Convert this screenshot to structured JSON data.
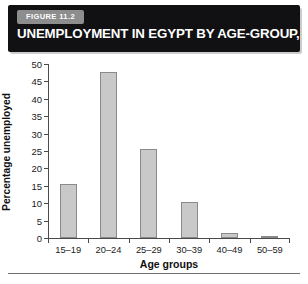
{
  "figure": {
    "badge": "FIGURE 11.2",
    "title": "UNEMPLOYMENT IN EGYPT BY AGE-GROUP, 2006",
    "banner_color": "#111113",
    "badge_color": "#8d8d8d"
  },
  "chart_data": {
    "type": "bar",
    "title": "UNEMPLOYMENT IN EGYPT BY AGE-GROUP, 2006",
    "xlabel": "Age groups",
    "ylabel": "Percentage unemployed",
    "categories": [
      "15–19",
      "20–24",
      "25–29",
      "30–39",
      "40–49",
      "50–59"
    ],
    "values": [
      15.5,
      47.8,
      25.7,
      10.3,
      1.5,
      0.3
    ],
    "ylim": [
      0,
      50
    ],
    "ytick_labels": [
      "0",
      "5",
      "10",
      "15",
      "20",
      "25",
      "30",
      "35",
      "40",
      "45",
      "50"
    ],
    "ytick_values": [
      0,
      5,
      10,
      15,
      20,
      25,
      30,
      35,
      40,
      45,
      50
    ],
    "grid": false,
    "legend": false,
    "bar_fill": "#c9c9c9",
    "bar_edge": "#8a8a8a",
    "axis_color": "#4a4a4a"
  }
}
